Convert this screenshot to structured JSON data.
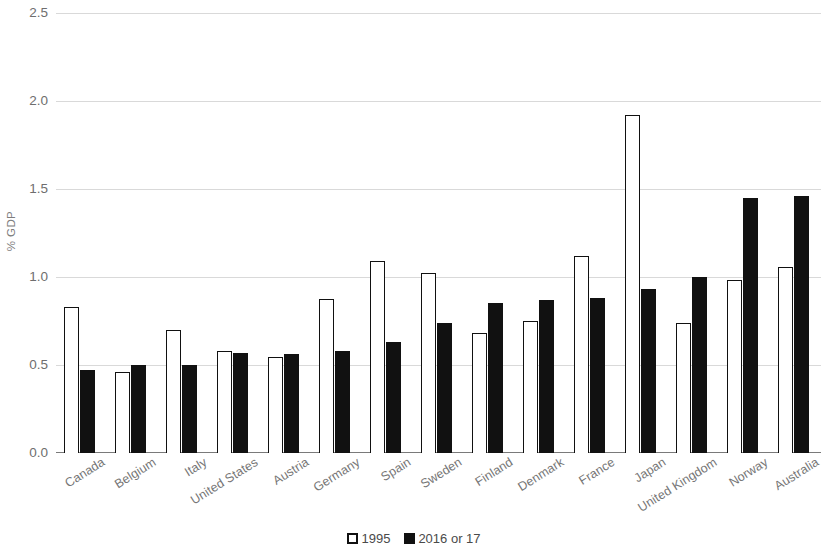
{
  "chart_data": {
    "type": "bar",
    "title": "",
    "xlabel": "",
    "ylabel": "% GDP",
    "ylim": [
      0.0,
      2.5
    ],
    "yticks": [
      0.0,
      0.5,
      1.0,
      1.5,
      2.0,
      2.5
    ],
    "ytick_labels": [
      "0.0",
      "0.5",
      "1.0",
      "1.5",
      "2.0",
      "2.5"
    ],
    "grid": true,
    "legend_position": "bottom-center",
    "categories": [
      "Canada",
      "Belgium",
      "Italy",
      "United States",
      "Austria",
      "Germany",
      "Spain",
      "Sweden",
      "Finland",
      "Denmark",
      "France",
      "Japan",
      "United Kingdom",
      "Norway",
      "Australia"
    ],
    "series": [
      {
        "name": "1995",
        "color": "#ffffff",
        "edge_color": "#111111",
        "values": [
          0.83,
          0.46,
          0.7,
          0.58,
          0.545,
          0.875,
          1.09,
          1.02,
          0.68,
          0.75,
          1.12,
          1.92,
          0.74,
          0.985,
          1.055
        ]
      },
      {
        "name": "2016 or 17",
        "color": "#111111",
        "edge_color": "#111111",
        "values": [
          0.47,
          0.5,
          0.5,
          0.57,
          0.565,
          0.58,
          0.63,
          0.74,
          0.855,
          0.87,
          0.88,
          0.93,
          1.0,
          1.45,
          1.46
        ]
      }
    ]
  },
  "legend": {
    "items": [
      {
        "label": "1995",
        "style": "hollow"
      },
      {
        "label": "2016 or 17",
        "style": "solid"
      }
    ]
  },
  "axis": {
    "y_title": "% GDP"
  }
}
